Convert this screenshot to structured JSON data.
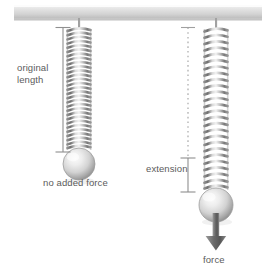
{
  "figure": {
    "background_color": "#ffffff",
    "text_color": "#5b5b5b",
    "metal_color": "#9a9a9a",
    "ceiling_color": "#d8d8d8"
  },
  "labels": {
    "original_length_line1": "original",
    "original_length_line2": "length",
    "no_added_force": "no added force",
    "extension": "extension",
    "force": "force"
  },
  "elements": {
    "ceiling_name": "ceiling-support-bar",
    "left_spring_name": "unloaded-spring",
    "right_spring_name": "loaded-spring",
    "left_mass_name": "unloaded-mass-sphere",
    "right_mass_name": "loaded-mass-sphere",
    "original_length_bar": "original-length-measure-bar",
    "extension_bar": "extension-measure-bar",
    "reference_dashed_line": "original-length-reference-dashed-line",
    "force_arrow": "downward-force-arrow"
  },
  "geometry": {
    "ceiling_y_top": 5,
    "ceiling_y_bottom": 20,
    "left_spring_x": 79,
    "left_spring_top": 27,
    "left_spring_bottom": 152,
    "left_spring_coils": 30,
    "right_spring_x": 216,
    "right_spring_top": 27,
    "right_spring_bottom": 192,
    "right_spring_coils": 26,
    "left_ball_cx": 79,
    "left_ball_cy": 164,
    "left_ball_r": 16,
    "right_ball_cx": 216,
    "right_ball_cy": 205,
    "right_ball_r": 17,
    "measure_bar_left_x": 63,
    "measure_bar_left_top": 27,
    "measure_bar_left_bottom": 152,
    "dashed_line_x": 188,
    "dashed_line_top": 27,
    "dashed_line_bottom": 158,
    "extension_bar_x": 188,
    "extension_bar_top": 158,
    "extension_bar_bottom": 192,
    "arrow_x": 216,
    "arrow_top": 213,
    "arrow_bottom": 250
  }
}
